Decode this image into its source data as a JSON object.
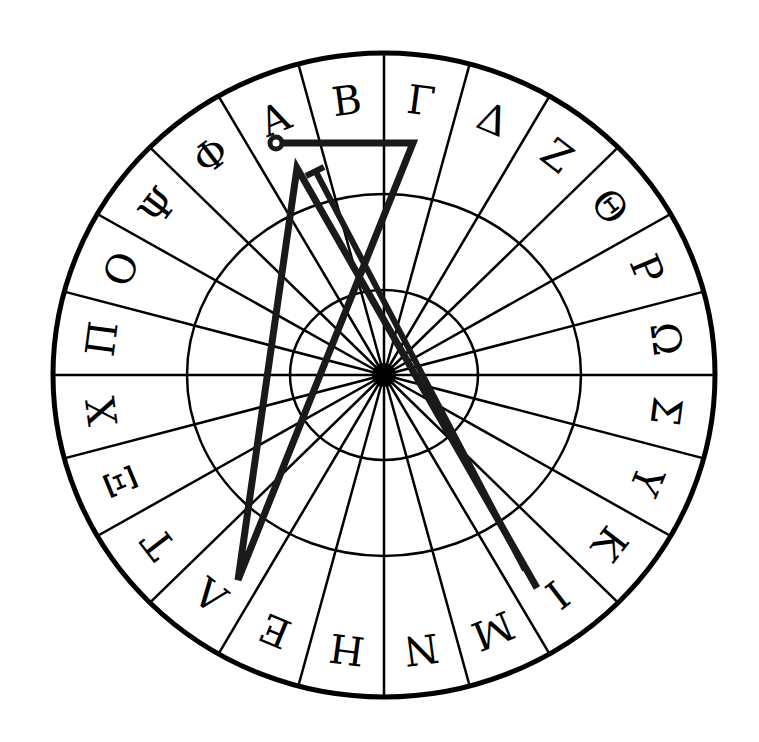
{
  "diagram": {
    "type": "greek-letter-wheel-sigil",
    "center": {
      "x": 384,
      "y": 375
    },
    "outer_radius": {
      "rx": 331,
      "ry": 322
    },
    "middle_ring": {
      "rx": 197,
      "ry": 181
    },
    "inner_ring": {
      "rx": 94,
      "ry": 85
    },
    "sector_count": 24,
    "letters_clockwise_from_top": [
      "Α",
      "Β",
      "Γ",
      "Δ",
      "Ζ",
      "Θ",
      "Ρ",
      "Ω",
      "Σ",
      "Υ",
      "Κ",
      "Ι",
      "Μ",
      "Ν",
      "Η",
      "Ε",
      "Λ",
      "Τ",
      "Ξ",
      "Χ",
      "Π",
      "Ο",
      "Ψ",
      "Φ"
    ],
    "sigil": {
      "start_circle": {
        "x": 276,
        "y": 143,
        "r": 6
      },
      "path_points": [
        [
          276,
          143
        ],
        [
          413,
          143
        ],
        [
          238,
          580
        ],
        [
          297,
          168
        ],
        [
          537,
          588
        ]
      ],
      "t_bar": {
        "x1": 306,
        "y1": 176,
        "x2": 324,
        "y2": 167
      },
      "parallel_line": [
        [
          316,
          172
        ],
        [
          525,
          570
        ]
      ]
    },
    "colors": {
      "ink": "#000000",
      "sigil": "#1a1a1a",
      "background": "#ffffff"
    }
  }
}
